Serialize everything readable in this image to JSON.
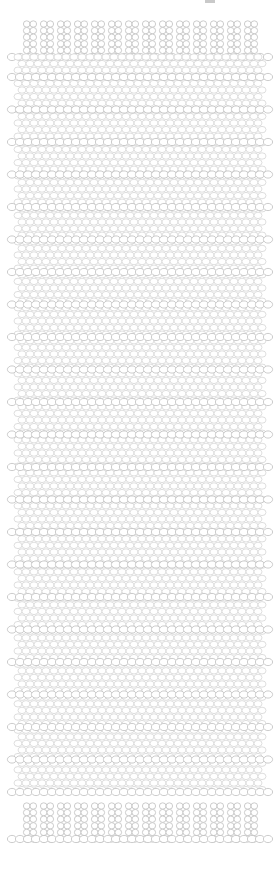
{
  "artwork": {
    "title": "Beadwork Loom Pattern",
    "kind": "bead-weaving-chart",
    "background_color": "#ffffff",
    "bead_outline_color": "#bfbfbf",
    "bead_outline_color_light": "#d6d6d6",
    "bead_fill_color": "#ffffff",
    "bead_outline_width": 0.8
  },
  "canvas": {
    "width": 280,
    "height": 875
  },
  "geometry": {
    "bead_radius_x": 4.0,
    "bead_radius_y": 3.2,
    "column_pitch": 8.0,
    "row_pitch": 6.6,
    "body_left": 18,
    "body_right": 262,
    "body_top": 57,
    "body_bottom": 800,
    "columns": 30,
    "body_rows": 112
  },
  "top_fringe": {
    "label": "top-fringe",
    "strand_count": 14,
    "strand_first_x": 30,
    "strand_pitch": 17.0,
    "beads_per_strand": 5,
    "top_y": 24,
    "bead_pitch_y": 6.6
  },
  "bottom_fringe": {
    "label": "bottom-fringe",
    "strand_count": 14,
    "strand_first_x": 30,
    "strand_pitch": 17.0,
    "beads_per_strand": 5,
    "top_y": 806,
    "bead_pitch_y": 6.6,
    "closed_base": true
  },
  "connector_bands": {
    "label": "horizontal-connector-band",
    "first_y": 77,
    "pitch_y": 32.5,
    "count": 23,
    "overhang": 6
  },
  "corner_mark": {
    "label": "crop-artifact",
    "x": 205,
    "y": 0,
    "width": 10,
    "height": 3,
    "color": "#c9c9c9"
  },
  "chart_data": {
    "type": "table",
    "xlabel": "bead column",
    "ylabel": "bead row",
    "categories": [
      "top-fringe",
      "body",
      "bottom-fringe"
    ],
    "values": [
      14,
      112,
      14
    ]
  }
}
